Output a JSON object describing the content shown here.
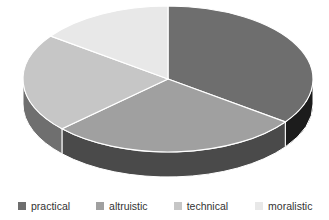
{
  "chart_data": {
    "type": "pie",
    "title": "",
    "subtitle": "",
    "xlabel": "",
    "ylabel": "",
    "three_d": true,
    "grid": false,
    "legend_position": "bottom",
    "start_angle_deg": 0,
    "direction": "clockwise",
    "categories": [
      "practical",
      "altruistic",
      "technical",
      "moralistic"
    ],
    "values": [
      35,
      28,
      22,
      15
    ],
    "units": "percent",
    "colors": [
      "#6e6e6e",
      "#a0a0a0",
      "#c6c6c6",
      "#e8e8e8"
    ],
    "side_colors": [
      "#1c1c1c",
      "#4a4a4a",
      "#6f6f6f",
      "#8f8f8f"
    ],
    "slices": [
      {
        "label": "practical",
        "value": 35,
        "color": "#6e6e6e",
        "side_color": "#1c1c1c",
        "start_deg": 0,
        "end_deg": 126
      },
      {
        "label": "altruistic",
        "value": 28,
        "color": "#a0a0a0",
        "side_color": "#4a4a4a",
        "start_deg": 126,
        "end_deg": 227
      },
      {
        "label": "technical",
        "value": 22,
        "color": "#c6c6c6",
        "side_color": "#6f6f6f",
        "start_deg": 227,
        "end_deg": 306
      },
      {
        "label": "moralistic",
        "value": 15,
        "color": "#e8e8e8",
        "side_color": "#8f8f8f",
        "start_deg": 306,
        "end_deg": 360
      }
    ],
    "geometry": {
      "center_x": 168,
      "center_y": 79,
      "radius_x": 145,
      "radius_y": 73,
      "depth": 25
    },
    "separator_color": "#ffffff"
  },
  "legend": {
    "items": [
      {
        "label": "practical",
        "color": "#6e6e6e"
      },
      {
        "label": "altruistic",
        "color": "#a0a0a0"
      },
      {
        "label": "technical",
        "color": "#c6c6c6"
      },
      {
        "label": "moralistic",
        "color": "#e8e8e8"
      }
    ]
  }
}
